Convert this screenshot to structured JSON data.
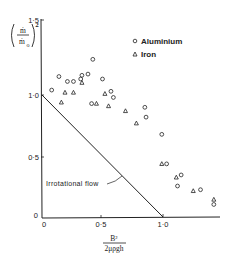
{
  "chart_data": {
    "type": "scatter",
    "title": "",
    "xlabel": "B² / 2μρgh",
    "ylabel": "(ṁ / ṁ₀)²",
    "xlim": [
      0,
      1.5
    ],
    "ylim": [
      0,
      1.5
    ],
    "x_ticks": [
      "0",
      "0·5",
      "1·0"
    ],
    "y_ticks": [
      "0",
      "0·5",
      "1·0",
      "1·5"
    ],
    "grid": false,
    "legend_position": "upper right",
    "series": [
      {
        "name": "Aluminium",
        "marker": "circle",
        "points": [
          [
            0.08,
            1.04
          ],
          [
            0.14,
            1.15
          ],
          [
            0.21,
            1.11
          ],
          [
            0.26,
            1.11
          ],
          [
            0.32,
            1.13
          ],
          [
            0.33,
            1.16
          ],
          [
            0.38,
            1.17
          ],
          [
            0.42,
            1.29
          ],
          [
            0.41,
            0.93
          ],
          [
            0.5,
            1.13
          ],
          [
            0.57,
            1.03
          ],
          [
            0.59,
            0.98
          ],
          [
            0.85,
            0.9
          ],
          [
            0.86,
            0.82
          ],
          [
            0.99,
            0.68
          ],
          [
            1.03,
            0.44
          ],
          [
            1.15,
            0.35
          ],
          [
            1.12,
            0.26
          ],
          [
            1.31,
            0.23
          ],
          [
            1.42,
            0.11
          ]
        ]
      },
      {
        "name": "Iron",
        "marker": "triangle",
        "points": [
          [
            0.19,
            1.02
          ],
          [
            0.26,
            1.02
          ],
          [
            0.16,
            0.94
          ],
          [
            0.33,
            1.1
          ],
          [
            0.45,
            0.93
          ],
          [
            0.52,
            1.01
          ],
          [
            0.55,
            0.91
          ],
          [
            0.69,
            0.87
          ],
          [
            0.78,
            0.77
          ],
          [
            0.99,
            0.44
          ],
          [
            1.11,
            0.33
          ],
          [
            1.25,
            0.22
          ],
          [
            1.42,
            0.15
          ]
        ]
      },
      {
        "name": "Irrotational flow",
        "type": "line",
        "points": [
          [
            0,
            1.0
          ],
          [
            1.0,
            0
          ]
        ]
      }
    ],
    "annotations": [
      {
        "text": "Irrotational flow",
        "points_to": "line"
      }
    ]
  },
  "labels": {
    "y_axis": {
      "numerator": "ṁ",
      "denominator": "ṁ",
      "denominator_sub": "o",
      "power": "2"
    },
    "x_axis": {
      "numerator": "B²",
      "denominator": "2μρgh"
    },
    "y_ticks": [
      "1·5",
      "1·0",
      "0·5",
      "0"
    ],
    "x_ticks": [
      "0",
      "0·5",
      "1·0"
    ],
    "legend": [
      {
        "label": "Aluminium",
        "marker": "circle"
      },
      {
        "label": "Iron",
        "marker": "triangle"
      }
    ],
    "annotation": "Irrotational flow"
  }
}
